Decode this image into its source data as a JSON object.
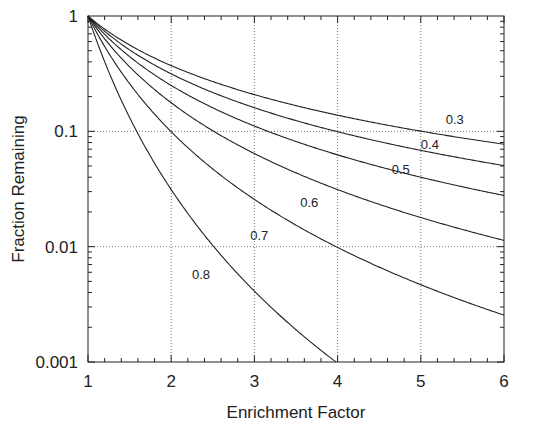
{
  "chart_data": {
    "type": "line",
    "title": "",
    "xlabel": "Enrichment Factor",
    "ylabel": "Fraction Remaining",
    "xlim": [
      1,
      6
    ],
    "ylim": [
      0.001,
      1
    ],
    "yscale": "log",
    "grid": true,
    "x_ticks": [
      "1",
      "2",
      "3",
      "4",
      "5",
      "6"
    ],
    "y_ticks": [
      "1",
      "0.1",
      "0.01",
      "0.001"
    ],
    "formula": "F = x^(-1/(1-p))",
    "series": [
      {
        "name": "0.3",
        "param": 0.3,
        "x": [
          1,
          2,
          3,
          4,
          5,
          6
        ],
        "values": [
          1,
          0.372,
          0.208,
          0.138,
          0.1,
          0.077
        ],
        "label_pos": [
          5.3,
          0.115
        ]
      },
      {
        "name": "0.4",
        "param": 0.4,
        "x": [
          1,
          2,
          3,
          4,
          5,
          6
        ],
        "values": [
          1,
          0.315,
          0.16,
          0.099,
          0.068,
          0.05
        ],
        "label_pos": [
          5.0,
          0.07
        ]
      },
      {
        "name": "0.5",
        "param": 0.5,
        "x": [
          1,
          2,
          3,
          4,
          5,
          6
        ],
        "values": [
          1,
          0.25,
          0.111,
          0.0625,
          0.04,
          0.028
        ],
        "label_pos": [
          4.65,
          0.043
        ]
      },
      {
        "name": "0.6",
        "param": 0.6,
        "x": [
          1,
          2,
          3,
          4,
          5,
          6
        ],
        "values": [
          1,
          0.177,
          0.064,
          0.031,
          0.018,
          0.011
        ],
        "label_pos": [
          3.55,
          0.022
        ]
      },
      {
        "name": "0.7",
        "param": 0.7,
        "x": [
          1,
          2,
          3,
          4,
          5,
          6
        ],
        "values": [
          1,
          0.099,
          0.026,
          0.0099,
          0.0047,
          0.0025
        ],
        "label_pos": [
          2.95,
          0.0115
        ]
      },
      {
        "name": "0.8",
        "param": 0.8,
        "x": [
          1,
          2,
          3,
          4
        ],
        "values": [
          1,
          0.031,
          0.0041,
          0.00098
        ],
        "label_pos": [
          2.25,
          0.0052
        ]
      }
    ]
  }
}
